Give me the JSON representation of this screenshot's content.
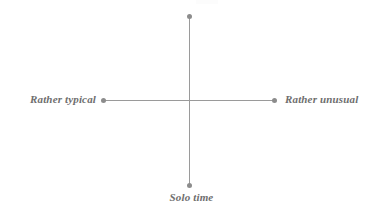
{
  "diagram": {
    "type": "quadrant-axis-cross",
    "axes": {
      "horizontal": {
        "left_label": "Rather typical",
        "right_label": "Rather unusual"
      },
      "vertical": {
        "top_label": "",
        "bottom_label": "Solo time"
      }
    },
    "endpoints": [
      {
        "name": "left-endpoint",
        "x": 103,
        "y": 100
      },
      {
        "name": "right-endpoint",
        "x": 274,
        "y": 100
      },
      {
        "name": "top-endpoint",
        "x": 189,
        "y": 16
      },
      {
        "name": "bottom-endpoint",
        "x": 189,
        "y": 185
      }
    ],
    "origin": {
      "x": 189,
      "y": 100
    },
    "colors": {
      "axis_line": "#9a9a9a",
      "endpoint_dot": "#8c8c8c",
      "label_text": "#6e6e6e",
      "background": "#ffffff"
    }
  }
}
